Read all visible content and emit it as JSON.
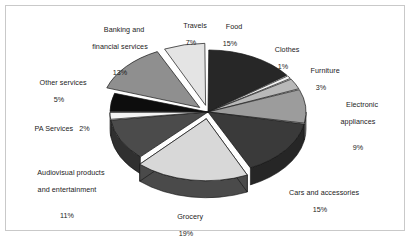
{
  "chart_data": {
    "type": "pie",
    "title": "",
    "subtitle": "",
    "xlabel": "",
    "ylabel": "",
    "grid": false,
    "legend_position": "none",
    "label_format": "name + percent",
    "exploded_slices": [
      "Travels",
      "Banking and financial services",
      "Grocery"
    ],
    "three_d": true,
    "start_angle_deg": -90,
    "direction": "clockwise",
    "total_percent": 100,
    "categories": [
      "Food",
      "Clothes",
      "Furniture",
      "Electronic appliances",
      "Cars and accessories",
      "Grocery",
      "Audiovisual products and entertainment",
      "PA Services",
      "Other services",
      "Banking and financial services",
      "Travels"
    ],
    "values": [
      15,
      1,
      3,
      9,
      15,
      19,
      11,
      2,
      5,
      13,
      7
    ],
    "units": "%",
    "slices": [
      {
        "label": "Food",
        "percent": 15,
        "percent_text": "15%",
        "color": "#272727",
        "side_color": "#181818"
      },
      {
        "label": "Clothes",
        "percent": 1,
        "percent_text": "1%",
        "color": "#f2f2f2",
        "side_color": "#c6c6c6"
      },
      {
        "label": "Furniture",
        "percent": 3,
        "percent_text": "3%",
        "color": "#b9b9b9",
        "side_color": "#8d8d8d"
      },
      {
        "label": "Electronic appliances",
        "percent": 9,
        "percent_text": "9%",
        "color": "#9c9c9c",
        "side_color": "#767676"
      },
      {
        "label": "Cars and accessories",
        "percent": 15,
        "percent_text": "15%",
        "color": "#3a3a3a",
        "side_color": "#262626"
      },
      {
        "label": "Grocery",
        "percent": 19,
        "percent_text": "19%",
        "color": "#d8d8d8",
        "side_color": "#4a4a4a"
      },
      {
        "label": "Audiovisual products and entertainment",
        "percent": 11,
        "percent_text": "11%",
        "color": "#4b4b4b",
        "side_color": "#303030"
      },
      {
        "label": "PA Services",
        "percent": 2,
        "percent_text": "2%",
        "color": "#f4f4f4",
        "side_color": "#c0c0c0"
      },
      {
        "label": "Other services",
        "percent": 5,
        "percent_text": "5%",
        "color": "#0d0d0d",
        "side_color": "#070707"
      },
      {
        "label": "Banking and financial services",
        "percent": 13,
        "percent_text": "13%",
        "color": "#8f8f8f",
        "side_color": "#5e5e5e"
      },
      {
        "label": "Travels",
        "percent": 7,
        "percent_text": "7%",
        "color": "#e4e4e4",
        "side_color": "#a9a9a9"
      }
    ]
  },
  "labels": {
    "food": {
      "name": "Food",
      "pct": "15%"
    },
    "clothes": {
      "name": "Clothes",
      "pct": "1%"
    },
    "furniture": {
      "name": "Furniture",
      "pct": "3%"
    },
    "electronic": {
      "line1": "Electronic",
      "line2": "appliances",
      "pct": "9%"
    },
    "cars": {
      "name": "Cars and accessories",
      "pct": "15%"
    },
    "grocery": {
      "name": "Grocery",
      "pct": "19%"
    },
    "audiovisual": {
      "line1": "Audiovisual products",
      "line2": "and entertainment",
      "pct": "11%"
    },
    "pa_services": {
      "name": "PA Services   2%"
    },
    "other_services": {
      "name": "Other services",
      "pct": "5%"
    },
    "banking": {
      "line1": "Banking and",
      "line2": "financial services",
      "pct": "13%"
    },
    "travels": {
      "name": "Travels",
      "pct": "7%"
    }
  },
  "colors": {
    "frame_border": "#c9c9c9",
    "background": "#ffffff",
    "text": "#1b1b1b"
  }
}
